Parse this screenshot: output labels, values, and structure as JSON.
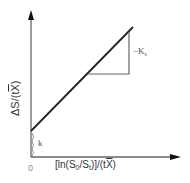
{
  "figure": {
    "y_axis_label_prefix": "ΔS/(t",
    "y_axis_label_var": "X",
    "y_axis_label_suffix": ")",
    "x_axis_label_prefix": "[ln(S",
    "x_axis_label_sub0": "0",
    "x_axis_label_mid": "/S",
    "x_axis_label_subt": "t",
    "x_axis_label_mid2": ")]/(t",
    "x_axis_label_var": "X",
    "x_axis_label_suffix": ")",
    "origin_label": "0",
    "intercept_label": "k",
    "slope_label": "−K",
    "slope_label_sub": "s",
    "colors": {
      "axis": "#555555",
      "line": "#222222",
      "triangle": "#555555",
      "text": "#333333"
    }
  }
}
